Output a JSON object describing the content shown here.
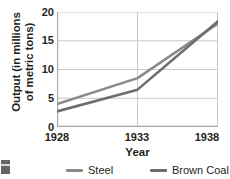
{
  "chart_data": {
    "type": "line",
    "title": "",
    "xlabel": "Year",
    "ylabel": "Output (in millions of metric tons)",
    "ylabel_line1": "Output (in millions",
    "ylabel_line2": "of metric tons)",
    "x": [
      1928,
      1933,
      1938
    ],
    "xlim": [
      1928,
      1938
    ],
    "ylim": [
      0,
      20
    ],
    "xticks": [
      "1928",
      "1933",
      "1938"
    ],
    "yticks": [
      "0",
      "5",
      "10",
      "15",
      "20"
    ],
    "grid": true,
    "legend_position": "bottom",
    "series": [
      {
        "name": "Steel",
        "color": "#8a8a8a",
        "values": [
          4.0,
          8.5,
          18.0
        ]
      },
      {
        "name": "Brown Coal",
        "color": "#6d6d6d",
        "values": [
          2.7,
          6.5,
          18.4
        ]
      }
    ]
  },
  "axis": {
    "line_color": "#a9a9a9",
    "grid_color": "#c9c9c9",
    "text_color": "#231f20"
  }
}
